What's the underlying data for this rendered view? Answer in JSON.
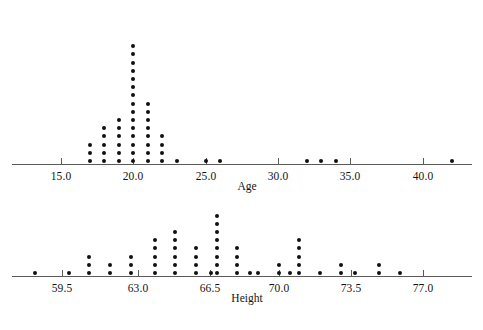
{
  "figure": {
    "width": 483,
    "height": 330,
    "background": "#ffffff",
    "dot_color": "#111111",
    "axis_color": "#5a5a5a",
    "text_color": "#141414"
  },
  "chart_data": [
    {
      "type": "scatter",
      "plot_style": "dotplot",
      "title": "",
      "xlabel": "Age",
      "ylabel": "",
      "grid": false,
      "legend": null,
      "axis": {
        "tick_labels": [
          "15.0",
          "20.0",
          "25.0",
          "30.0",
          "35.0",
          "40.0"
        ],
        "tick_values": [
          15.0,
          20.0,
          25.0,
          30.0,
          35.0,
          40.0
        ],
        "xlim": [
          12.5,
          44.0
        ],
        "px_per_unit": 14.5,
        "origin_px": {
          "x": 61,
          "value": 15.0
        },
        "baseline_y": 164,
        "line_x0": 12,
        "line_x1": 472
      },
      "x": [
        17,
        18,
        19,
        20,
        21,
        22,
        23,
        25,
        26,
        32,
        33,
        34,
        42
      ],
      "counts": [
        3,
        5,
        6,
        15,
        8,
        4,
        1,
        1,
        1,
        1,
        1,
        1,
        1
      ],
      "n": 44
    },
    {
      "type": "scatter",
      "plot_style": "dotplot",
      "title": "",
      "xlabel": "Height",
      "ylabel": "",
      "grid": false,
      "legend": null,
      "axis": {
        "tick_labels": [
          "59.5",
          "63.0",
          "66.5",
          "70.0",
          "73.5",
          "77.0"
        ],
        "tick_values": [
          59.5,
          63.0,
          66.5,
          70.0,
          73.5,
          77.0
        ],
        "xlim": [
          57.3,
          79.0
        ],
        "px_per_unit": 20.6,
        "origin_px": {
          "x": 62,
          "value": 59.5
        },
        "baseline_y": 276,
        "line_x0": 12,
        "line_x1": 472
      },
      "x": [
        58.2,
        59.9,
        60.9,
        61.9,
        63.0,
        64.0,
        64.7,
        65.7,
        66.4,
        66.8,
        67.4,
        68.1,
        68.6,
        69.0,
        70.0,
        70.4,
        71.0,
        72.0,
        72.9,
        73.6,
        74.6,
        75.8
      ],
      "counts": [
        1,
        1,
        3,
        2,
        3,
        5,
        6,
        4,
        3,
        1,
        8,
        4,
        1,
        1,
        2,
        1,
        5,
        1,
        2,
        1,
        2,
        1
      ],
      "n": 58
    }
  ],
  "panels": [
    {
      "name": "age-panel",
      "axis_title": "Age",
      "ticks": [
        {
          "label": "15.0",
          "x": 61
        },
        {
          "label": "20.0",
          "x": 133
        },
        {
          "label": "25.0",
          "x": 206
        },
        {
          "label": "30.0",
          "x": 278
        },
        {
          "label": "35.0",
          "x": 350
        },
        {
          "label": "40.0",
          "x": 423
        }
      ],
      "axis_y": 164,
      "axis_x0": 12,
      "axis_x1": 472,
      "title_x": 247,
      "title_y": 180,
      "stacks": [
        {
          "x": 90,
          "count": 3
        },
        {
          "x": 104,
          "count": 5
        },
        {
          "x": 119,
          "count": 6
        },
        {
          "x": 133,
          "count": 15
        },
        {
          "x": 148,
          "count": 8
        },
        {
          "x": 162,
          "count": 4
        },
        {
          "x": 177,
          "count": 1
        },
        {
          "x": 206,
          "count": 1
        },
        {
          "x": 220,
          "count": 1
        },
        {
          "x": 307,
          "count": 1
        },
        {
          "x": 321,
          "count": 1
        },
        {
          "x": 336,
          "count": 1
        },
        {
          "x": 452,
          "count": 1
        }
      ]
    },
    {
      "name": "height-panel",
      "axis_title": "Height",
      "ticks": [
        {
          "label": "59.5",
          "x": 62
        },
        {
          "label": "63.0",
          "x": 138
        },
        {
          "label": "66.5",
          "x": 210
        },
        {
          "label": "70.0",
          "x": 279
        },
        {
          "label": "73.5",
          "x": 351
        },
        {
          "label": "77.0",
          "x": 423
        }
      ],
      "axis_y": 276,
      "axis_x0": 12,
      "axis_x1": 472,
      "title_x": 247,
      "title_y": 292,
      "stacks": [
        {
          "x": 35,
          "count": 1
        },
        {
          "x": 69,
          "count": 1
        },
        {
          "x": 89,
          "count": 3
        },
        {
          "x": 110,
          "count": 2
        },
        {
          "x": 131,
          "count": 3
        },
        {
          "x": 155,
          "count": 5
        },
        {
          "x": 175,
          "count": 6
        },
        {
          "x": 196,
          "count": 4
        },
        {
          "x": 211,
          "count": 1
        },
        {
          "x": 217,
          "count": 8
        },
        {
          "x": 237,
          "count": 4
        },
        {
          "x": 250,
          "count": 1
        },
        {
          "x": 258,
          "count": 1
        },
        {
          "x": 279,
          "count": 2
        },
        {
          "x": 290,
          "count": 1
        },
        {
          "x": 299,
          "count": 5
        },
        {
          "x": 320,
          "count": 1
        },
        {
          "x": 341,
          "count": 2
        },
        {
          "x": 355,
          "count": 1
        },
        {
          "x": 379,
          "count": 2
        },
        {
          "x": 400,
          "count": 1
        }
      ]
    }
  ]
}
